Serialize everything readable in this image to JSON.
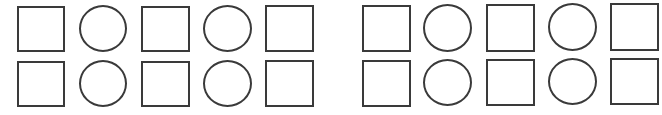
{
  "stroke_color": "#3a3a3a",
  "background": "#ffffff",
  "groups": [
    {
      "name": "left-group",
      "rows": [
        [
          {
            "type": "square",
            "x": 17,
            "y": 6,
            "w": 48,
            "h": 46
          },
          {
            "type": "circle",
            "x": 79,
            "y": 5,
            "w": 48,
            "h": 47
          },
          {
            "type": "square",
            "x": 141,
            "y": 6,
            "w": 49,
            "h": 46
          },
          {
            "type": "circle",
            "x": 203,
            "y": 5,
            "w": 49,
            "h": 47
          },
          {
            "type": "square",
            "x": 265,
            "y": 5,
            "w": 49,
            "h": 47
          }
        ],
        [
          {
            "type": "square",
            "x": 17,
            "y": 61,
            "w": 48,
            "h": 46
          },
          {
            "type": "circle",
            "x": 79,
            "y": 60,
            "w": 48,
            "h": 47
          },
          {
            "type": "square",
            "x": 141,
            "y": 61,
            "w": 49,
            "h": 46
          },
          {
            "type": "circle",
            "x": 203,
            "y": 60,
            "w": 49,
            "h": 47
          },
          {
            "type": "square",
            "x": 265,
            "y": 60,
            "w": 49,
            "h": 47
          }
        ]
      ]
    },
    {
      "name": "right-group",
      "rows": [
        [
          {
            "type": "square",
            "x": 362,
            "y": 5,
            "w": 49,
            "h": 47
          },
          {
            "type": "circle",
            "x": 423,
            "y": 4,
            "w": 49,
            "h": 48
          },
          {
            "type": "square",
            "x": 486,
            "y": 4,
            "w": 49,
            "h": 48
          },
          {
            "type": "circle",
            "x": 548,
            "y": 3,
            "w": 49,
            "h": 48
          },
          {
            "type": "square",
            "x": 610,
            "y": 3,
            "w": 49,
            "h": 48
          }
        ],
        [
          {
            "type": "square",
            "x": 362,
            "y": 60,
            "w": 49,
            "h": 47
          },
          {
            "type": "circle",
            "x": 423,
            "y": 59,
            "w": 49,
            "h": 47
          },
          {
            "type": "square",
            "x": 486,
            "y": 59,
            "w": 49,
            "h": 47
          },
          {
            "type": "circle",
            "x": 548,
            "y": 58,
            "w": 49,
            "h": 47
          },
          {
            "type": "square",
            "x": 610,
            "y": 58,
            "w": 49,
            "h": 47
          }
        ]
      ]
    }
  ]
}
